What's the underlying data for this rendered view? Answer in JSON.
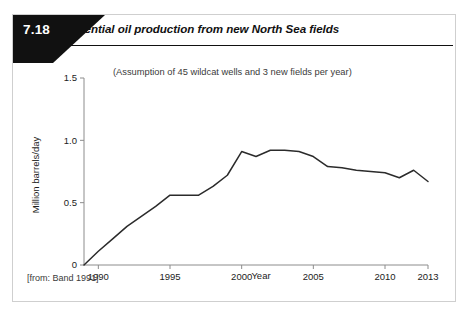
{
  "figure": {
    "number": "7.18",
    "title": "Potential oil production from new North Sea fields",
    "source_note": "[from: Band 1991]"
  },
  "chart_data": {
    "type": "line",
    "title": "Potential oil production from new North Sea fields",
    "subtitle": "(Assumption of 45 wildcat wells and 3 new fields per year)",
    "xlabel": "Year",
    "ylabel": "Million barrels/day",
    "xlim": [
      1989,
      2013
    ],
    "ylim": [
      0,
      1.5
    ],
    "xticks": [
      1990,
      1995,
      2000,
      2005,
      2010,
      2013
    ],
    "xticklabels": [
      "1990",
      "1995",
      "2000",
      "2005",
      "2010",
      "2013"
    ],
    "yticks": [
      0,
      0.5,
      1.0,
      1.5
    ],
    "yticklabels": [
      "0",
      "0.5",
      "1.0",
      "1.5"
    ],
    "grid": false,
    "legend": "none",
    "line_color": "#2b2b2b",
    "series": [
      {
        "name": "Potential oil production",
        "x": [
          1989,
          1990,
          1991,
          1992,
          1993,
          1994,
          1995,
          1996,
          1997,
          1998,
          1999,
          2000,
          2001,
          2002,
          2003,
          2004,
          2005,
          2006,
          2007,
          2008,
          2009,
          2010,
          2011,
          2012,
          2013
        ],
        "values": [
          0.0,
          0.11,
          0.21,
          0.31,
          0.39,
          0.47,
          0.56,
          0.56,
          0.56,
          0.63,
          0.72,
          0.91,
          0.87,
          0.92,
          0.92,
          0.91,
          0.87,
          0.79,
          0.78,
          0.76,
          0.75,
          0.74,
          0.7,
          0.76,
          0.67
        ]
      }
    ]
  },
  "colors": {
    "badge_background": "#111111",
    "badge_text": "#ffffff",
    "axis": "#8c8c8c",
    "series": "#2b2b2b",
    "card_border": "#cfcfcf"
  }
}
